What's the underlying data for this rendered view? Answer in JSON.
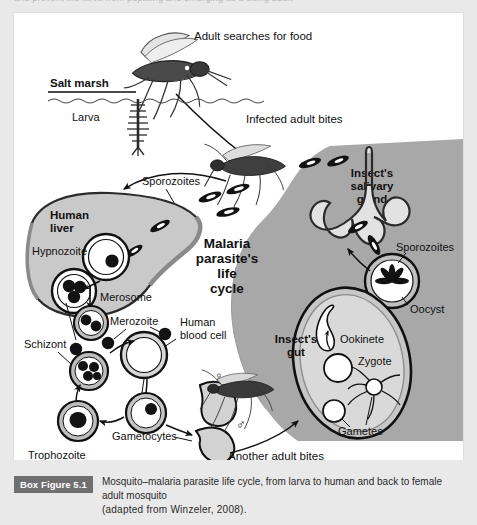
{
  "page": {
    "clipped_top_text": "and prevent the larva from pupating and emerging as a biting adult"
  },
  "figure": {
    "title_lines": [
      "Malaria",
      "parasite's",
      "life",
      "cycle"
    ],
    "habitat_label": "Salt marsh",
    "larva_label": "Larva",
    "flow_labels": {
      "adult_searches": "Adult searches for food",
      "infected_bites": "Infected adult bites",
      "another_bites": "Another adult bites"
    },
    "human_side": {
      "liver_label": [
        "Human",
        "liver"
      ],
      "sporozoites": "Sporozoites",
      "hypnozoite": "Hypnozoite",
      "merosome": "Merosome",
      "schizont": "Schizont",
      "merozoite": "Merozoite",
      "blood_cell": [
        "Human",
        "blood cell"
      ],
      "trophozoite": "Trophozoite",
      "gametocytes": "Gametocytes",
      "female_symbol": "♀",
      "male_symbol": "♂"
    },
    "insect_side": {
      "salivary_gland": [
        "Insect's",
        "salivary",
        "gland"
      ],
      "sporozoites": "Sporozoites",
      "oocyst": "Oocyst",
      "gut_label": [
        "Insect's",
        "gut"
      ],
      "ookinete": "Ookinete",
      "zygote": "Zygote",
      "gametes": "Gametes"
    }
  },
  "caption": {
    "badge": "Box Figure 5.1",
    "line1": "Mosquito–malaria parasite life cycle, from larva to human and back to female adult mosquito",
    "line2": "(adapted from Winzeler, 2008)."
  },
  "colors": {
    "page_background": "#e9e9e9",
    "card_background": "#ffffff",
    "insect_body_gray": "#a8a8a8",
    "organ_fill_gray": "#c9c9c9",
    "cell_fill_gray": "#d7d7d7",
    "parasite_black": "#121212",
    "badge_gray": "#6f6f6f",
    "ink": "#111111"
  }
}
